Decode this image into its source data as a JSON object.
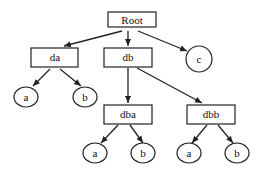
{
  "diagram": {
    "type": "tree",
    "stroke_color": "#222222",
    "nodes": {
      "root": {
        "label": "Root",
        "shape": "box"
      },
      "da": {
        "label": "da",
        "shape": "box"
      },
      "db": {
        "label": "db",
        "shape": "box"
      },
      "c": {
        "label": "c",
        "shape": "circle"
      },
      "da_a": {
        "label": "a",
        "shape": "circle"
      },
      "da_b": {
        "label": "b",
        "shape": "circle"
      },
      "dba": {
        "label": "dba",
        "shape": "box"
      },
      "dbb": {
        "label": "dbb",
        "shape": "box"
      },
      "dba_a": {
        "label": "a",
        "shape": "circle"
      },
      "dba_b": {
        "label": "b",
        "shape": "circle"
      },
      "dbb_a": {
        "label": "a",
        "shape": "circle"
      },
      "dbb_b": {
        "label": "b",
        "shape": "circle"
      }
    },
    "edges": [
      [
        "root",
        "da"
      ],
      [
        "root",
        "db"
      ],
      [
        "root",
        "c"
      ],
      [
        "da",
        "da_a"
      ],
      [
        "da",
        "da_b"
      ],
      [
        "db",
        "dba"
      ],
      [
        "db",
        "dbb"
      ],
      [
        "dba",
        "dba_a"
      ],
      [
        "dba",
        "dba_b"
      ],
      [
        "dbb",
        "dbb_a"
      ],
      [
        "dbb",
        "dbb_b"
      ]
    ]
  }
}
